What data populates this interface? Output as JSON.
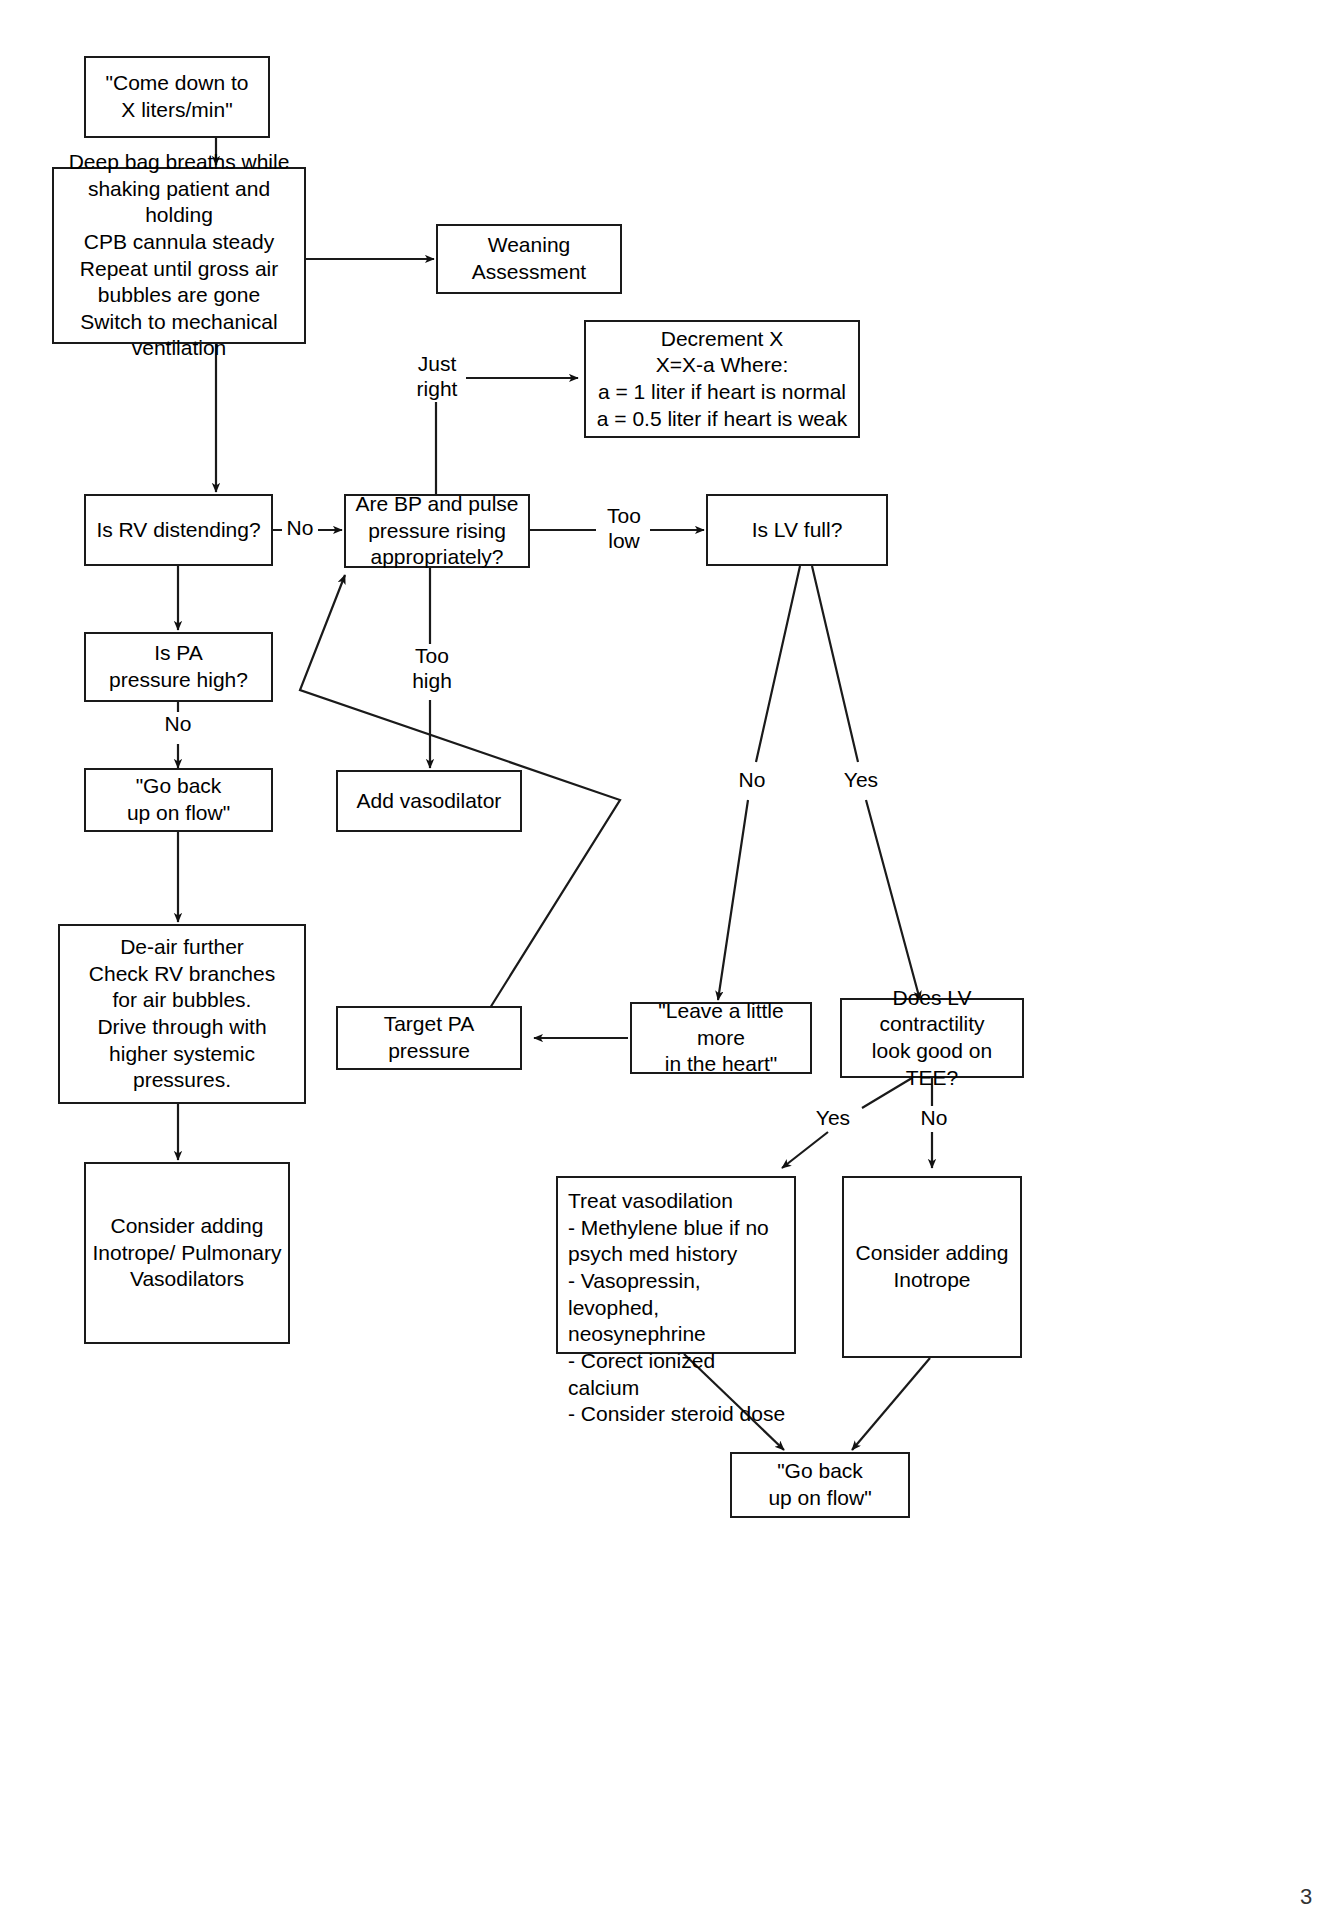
{
  "diagram": {
    "page_marker": "3",
    "stroke_color": "#1a1a1a",
    "background_color": "#ffffff",
    "nodes": {
      "come_down": "\"Come down to\nX liters/min\"",
      "deep_bag_breaths": "Deep bag breaths while\nshaking patient and holding\nCPB cannula steady\nRepeat until gross air\nbubbles are gone\nSwitch to mechanical\nventilation",
      "weaning_assessment": "Weaning\nAssessment",
      "decrement_x": "Decrement X\nX=X-a Where:\na = 1 liter if heart is normal\na = 0.5 liter if heart is weak",
      "rv_distending": "Is RV distending?",
      "bp_pulse_rising": "Are BP and pulse\npressure rising\nappropriately?",
      "lv_full": "Is LV full?",
      "pa_pressure_high": "Is PA\npressure high?",
      "go_back_up_left": "\"Go back\nup on flow\"",
      "add_vasodilator": "Add vasodilator",
      "de_air_further": "De-air further\nCheck RV branches\nfor air bubbles.\nDrive through with\nhigher systemic pressures.",
      "target_pa_pressure": "Target PA\npressure",
      "leave_a_little_more": "\"Leave a little more\nin the heart\"",
      "lv_contractility_tee": "Does LV\ncontractility\nlook good on TEE?",
      "consider_adding_inotrope_pulm": "Consider adding\nInotrope/ Pulmonary\nVasodilators",
      "treat_vasodilation": "Treat vasodilation\n- Methylene blue if no\npsych med history\n- Vasopressin, levophed,\nneosynephrine\n- Corect ionized calcium\n- Consider steroid dose",
      "consider_adding_inotrope": "Consider adding\nInotrope",
      "go_back_up_bottom": "\"Go back\nup on flow\""
    },
    "edge_labels": {
      "just_right": "Just\nright",
      "no_rv": "No",
      "too_low": "Too\nlow",
      "too_high": "Too\nhigh",
      "no_pa": "No",
      "lv_no": "No",
      "lv_yes": "Yes",
      "tee_yes": "Yes",
      "tee_no": "No"
    }
  }
}
